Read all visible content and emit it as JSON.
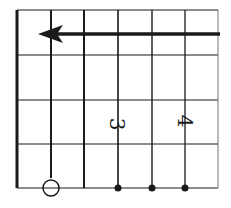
{
  "diagram": {
    "type": "guitar-chord-diagram",
    "orientation": "rotated",
    "strings": 6,
    "frets": 4,
    "barre_arrow": {
      "direction": "left",
      "row": "top"
    },
    "open_string_marker": {
      "symbol": "circle",
      "string_index": 1
    },
    "string_dots": [
      3,
      4,
      5
    ],
    "finger_labels": [
      {
        "text": "3",
        "string_index": 3
      },
      {
        "text": "4",
        "string_index": 5
      }
    ],
    "colors": {
      "line": "#1a1a1a",
      "grid": "#555555",
      "background": "#ffffff"
    }
  }
}
